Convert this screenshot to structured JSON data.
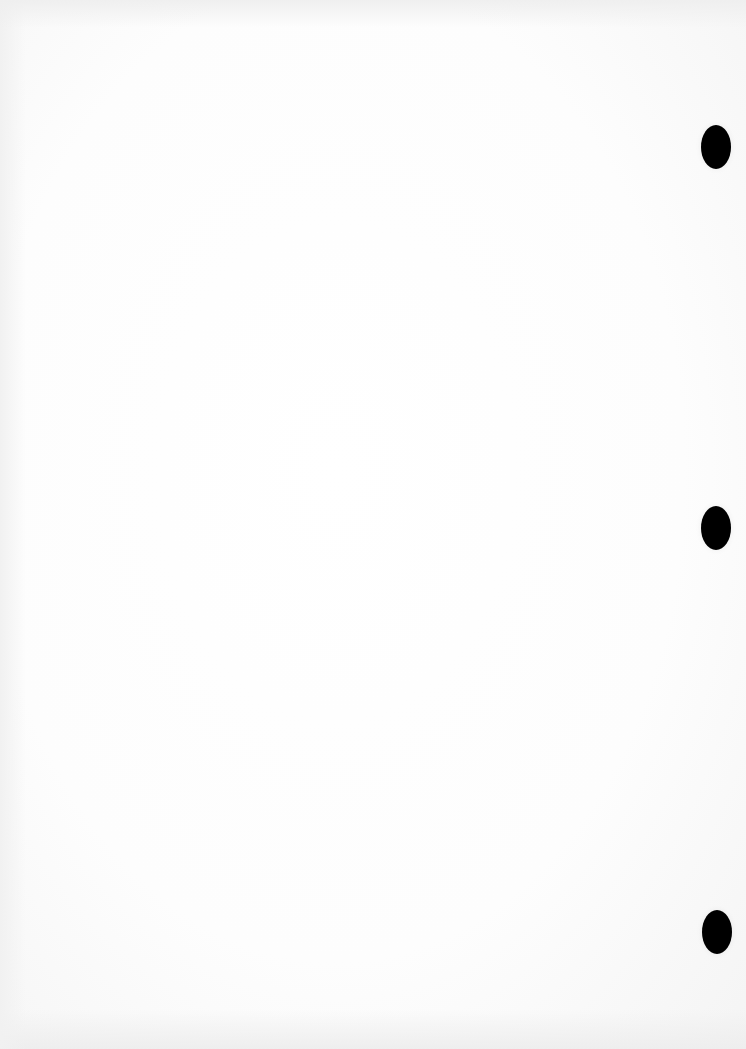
{
  "document": {
    "type": "blank-scanned-page",
    "background_color": "#ffffff",
    "text": ""
  },
  "punch_holes": [
    {
      "x": 701,
      "y": 125,
      "w": 30,
      "h": 44,
      "color": "#000000"
    },
    {
      "x": 701,
      "y": 506,
      "w": 30,
      "h": 44,
      "color": "#000000"
    },
    {
      "x": 702,
      "y": 910,
      "w": 30,
      "h": 44,
      "color": "#000000"
    }
  ]
}
